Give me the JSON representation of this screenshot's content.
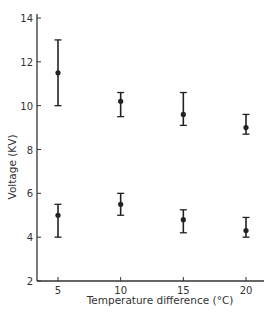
{
  "chart_data": {
    "type": "scatter",
    "title": "",
    "xlabel": "Temperature difference (°C)",
    "ylabel": "Voltage (KV)",
    "x_ticks": [
      5,
      10,
      15,
      20
    ],
    "y_ticks": [
      2,
      4,
      6,
      8,
      10,
      12,
      14
    ],
    "xlim": [
      3.3,
      21.5
    ],
    "ylim": [
      2,
      14
    ],
    "grid": false,
    "legend": null,
    "error_bars": true,
    "series": [
      {
        "name": "upper",
        "x": [
          5,
          10,
          15,
          20
        ],
        "y": [
          11.5,
          10.2,
          9.6,
          9.0
        ],
        "y_low": [
          10.0,
          9.5,
          9.1,
          8.7
        ],
        "y_high": [
          13.0,
          10.6,
          10.6,
          9.6
        ]
      },
      {
        "name": "lower",
        "x": [
          5,
          10,
          15,
          20
        ],
        "y": [
          5.0,
          5.5,
          4.8,
          4.3
        ],
        "y_low": [
          4.0,
          5.0,
          4.2,
          4.0
        ],
        "y_high": [
          5.5,
          6.0,
          5.25,
          4.9
        ]
      }
    ],
    "colors": {
      "axis": "#333333",
      "marker": "#222222"
    }
  }
}
